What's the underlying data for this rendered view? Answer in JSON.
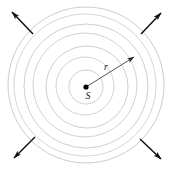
{
  "figure": {
    "canvas": {
      "width": 175,
      "height": 173
    },
    "background_color": "#ffffff",
    "center": {
      "x": 86,
      "y": 87
    },
    "labels": {
      "source": "S",
      "radius": "r"
    },
    "label_positions": {
      "source": {
        "x": 88,
        "y": 99
      },
      "radius": {
        "x": 106,
        "y": 70
      }
    },
    "colors": {
      "wavefront_stroke": "#c8c8c8",
      "wavefront_stroke_faint": "#d8d8d8",
      "radius_stroke": "#555555",
      "arrow_stroke": "#111111",
      "source_fill": "#000000",
      "label_fill": "#1a1a1a"
    },
    "source_dot": {
      "radius": 2.6
    },
    "wavefronts": {
      "count": 7,
      "stroke_width": 0.9,
      "circles": [
        {
          "cx": 86,
          "cy": 87,
          "r": 17,
          "stroke": "#c8c8c8"
        },
        {
          "cx": 85,
          "cy": 86,
          "r": 29,
          "stroke": "#cdcdcd"
        },
        {
          "cx": 87,
          "cy": 87,
          "r": 41,
          "stroke": "#c8c8c8"
        },
        {
          "cx": 85,
          "cy": 85,
          "r": 52,
          "stroke": "#cdcdcd"
        },
        {
          "cx": 86,
          "cy": 86,
          "r": 62,
          "stroke": "#c8c8c8"
        },
        {
          "cx": 85,
          "cy": 85,
          "r": 71,
          "stroke": "#d0d0d0"
        },
        {
          "cx": 86,
          "cy": 85,
          "r": 78,
          "stroke": "#c5c5c5"
        }
      ]
    },
    "radius_vector": {
      "label": "r",
      "from": {
        "x": 86,
        "y": 87
      },
      "to": {
        "x": 134,
        "y": 57
      },
      "stroke_width": 1.0,
      "arrow_size": 7
    },
    "propagation_arrows": [
      {
        "name": "top-left",
        "from": {
          "x": 33,
          "y": 34
        },
        "to": {
          "x": 12,
          "y": 12
        }
      },
      {
        "name": "top-right",
        "from": {
          "x": 141,
          "y": 34
        },
        "to": {
          "x": 161,
          "y": 13
        }
      },
      {
        "name": "bottom-left",
        "from": {
          "x": 35,
          "y": 137
        },
        "to": {
          "x": 14,
          "y": 158
        }
      },
      {
        "name": "bottom-right",
        "from": {
          "x": 140,
          "y": 139
        },
        "to": {
          "x": 161,
          "y": 159
        }
      }
    ]
  },
  "chart_data": {
    "type": "scatter",
    "xlabel": "",
    "ylabel": "",
    "annotations": [
      "S",
      "r"
    ],
    "series": [
      {
        "name": "wavefront radii (px)",
        "values": [
          17,
          29,
          41,
          52,
          62,
          71,
          78
        ]
      }
    ],
    "legend_position": "none",
    "grid": false
  }
}
